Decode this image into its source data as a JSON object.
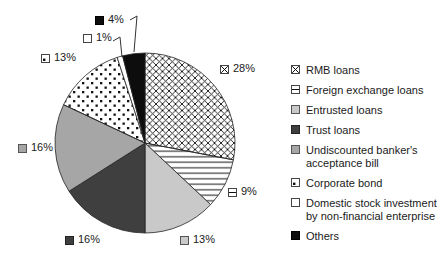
{
  "chart_data": {
    "type": "pie",
    "title": "",
    "start_angle_deg": 0,
    "direction": "clockwise",
    "legend_position": "right",
    "background": "#ffffff",
    "unit": "%",
    "categories": [
      "RMB loans",
      "Foreign exchange loans",
      "Entrusted loans",
      "Trust loans",
      "Undiscounted banker's acceptance bill",
      "Corporate bond",
      "Domestic stock investment by non-financial enterprise",
      "Others"
    ],
    "values": [
      28,
      9,
      13,
      16,
      16,
      13,
      1,
      4
    ],
    "fills": [
      "crosshatch",
      "hlines",
      "lightgray",
      "darkgray",
      "gray",
      "dots",
      "white",
      "black"
    ],
    "colors": {
      "lightgray": "#c9c9c9",
      "darkgray": "#3f3f3f",
      "gray": "#a6a6a6",
      "white": "#ffffff",
      "black": "#0d0d0d",
      "pattern_fg": "#111111",
      "outline": "#222222"
    }
  },
  "callouts": [
    {
      "text": "28%"
    },
    {
      "text": "9%"
    },
    {
      "text": "13%"
    },
    {
      "text": "16%"
    },
    {
      "text": "16%"
    },
    {
      "text": "13%"
    },
    {
      "text": "1%"
    },
    {
      "text": "4%"
    }
  ],
  "legend": {
    "items": [
      {
        "label": "RMB loans"
      },
      {
        "label": "Foreign exchange loans"
      },
      {
        "label": "Entrusted loans"
      },
      {
        "label": "Trust loans"
      },
      {
        "label": "Undiscounted banker's acceptance bill"
      },
      {
        "label": "Corporate bond"
      },
      {
        "label": "Domestic stock investment by non-financial enterprise"
      },
      {
        "label": "Others"
      }
    ]
  }
}
